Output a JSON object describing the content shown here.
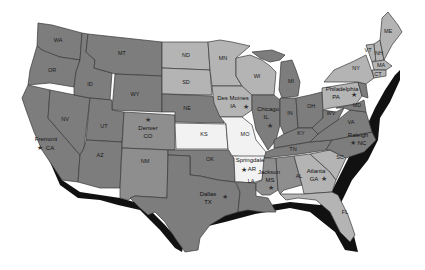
{
  "map": {
    "title": "",
    "colors": {
      "dark": "#7d7d7d",
      "mid": "#8e8e8e",
      "light": "#b4b4b4",
      "highlight": "#f2f2f2",
      "border": "#3a3a3a",
      "shadow": "#111111"
    },
    "states": {
      "WA": "WA",
      "OR": "OR",
      "CA": "CA",
      "NV": "NV",
      "ID": "ID",
      "MT": "MT",
      "WY": "WY",
      "UT": "UT",
      "AZ": "AZ",
      "CO": "CO",
      "NM": "NM",
      "ND": "ND",
      "SD": "SD",
      "NE": "NE",
      "KS": "KS",
      "OK": "OK",
      "TX": "TX",
      "MN": "MN",
      "IA": "IA",
      "MO": "MO",
      "AR": "AR",
      "LA": "LA",
      "WI": "WI",
      "IL": "IL",
      "MI": "MI",
      "IN": "IN",
      "OH": "OH",
      "KY": "KY",
      "TN": "TN",
      "MS": "MS",
      "AL": "AL",
      "GA": "GA",
      "FL": "FL",
      "SC": "SC",
      "NC": "NC",
      "VA": "VA",
      "WV": "WV",
      "PA": "PA",
      "NY": "NY",
      "VT": "VT",
      "NH": "NH",
      "ME": "ME",
      "MA": "MA",
      "CT": "CT",
      "MD": "MD",
      "DE": "DE",
      "NJ": "NJ"
    },
    "cities": [
      {
        "name": "Fremont",
        "state": "CA"
      },
      {
        "name": "Denver",
        "state": "CO"
      },
      {
        "name": "Dallas",
        "state": "TX"
      },
      {
        "name": "Des Moines",
        "state": "IA"
      },
      {
        "name": "Chicago",
        "state": "IL"
      },
      {
        "name": "Springdale",
        "state": "AR"
      },
      {
        "name": "Jackson",
        "state": "MS"
      },
      {
        "name": "Atlanta",
        "state": "GA"
      },
      {
        "name": "Raleigh",
        "state": "NC"
      },
      {
        "name": "Philadelphia",
        "state": "PA"
      }
    ],
    "star_glyph": "★"
  }
}
